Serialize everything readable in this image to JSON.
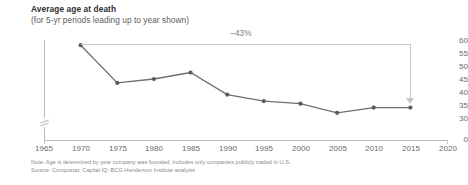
{
  "chart_data": {
    "type": "line",
    "title": "Average age at death",
    "subtitle": "(for 5-yr periods leading up to year shown)",
    "xlabel": "",
    "ylabel": "",
    "x": [
      1970,
      1975,
      1980,
      1985,
      1990,
      1995,
      2000,
      2005,
      2010,
      2015
    ],
    "values": [
      58,
      43.5,
      45,
      47.5,
      39,
      36.5,
      35.5,
      32,
      34,
      34
    ],
    "series": [
      {
        "name": "Average age at death",
        "values": [
          58,
          43.5,
          45,
          47.5,
          39,
          36.5,
          35.5,
          32,
          34,
          34
        ]
      }
    ],
    "xlim": [
      1965,
      2020
    ],
    "ylim": [
      30,
      60
    ],
    "y_axis_has_break": true,
    "y_zero_label": "0",
    "xticks": [
      1965,
      1970,
      1975,
      1980,
      1985,
      1990,
      1995,
      2000,
      2005,
      2010,
      2015,
      2020
    ],
    "yticks": [
      30,
      35,
      40,
      45,
      50,
      55,
      60
    ],
    "xticklabels": [
      "1965",
      "1970",
      "1975",
      "1980",
      "1985",
      "1990",
      "1995",
      "2000",
      "2005",
      "2010",
      "2015",
      "2020"
    ],
    "yticklabels": [
      "30",
      "35",
      "40",
      "45",
      "50",
      "55",
      "60"
    ],
    "grid": false,
    "legend": false,
    "annotations": [
      {
        "label": "–43%",
        "from_x": 1970,
        "to_x": 2015,
        "type": "bracket-arrow",
        "description": "Horizontal connector from 1970 data point to a downward arrow at the 2015 data point"
      }
    ],
    "series_color": "#6e6e6e",
    "marker_color": "#5a5a5a",
    "annotation_color": "#c6c6c6",
    "axis_color": "#b9b9b9",
    "text_color": "#6b6b6b",
    "background": "#ffffff"
  },
  "footnotes": {
    "note": "Note: Age is determined by year company was founded. Includes only companies publicly traded in U.S.",
    "source": "Source: Compustat; Capital IQ; BCG Henderson Institute analysis"
  }
}
